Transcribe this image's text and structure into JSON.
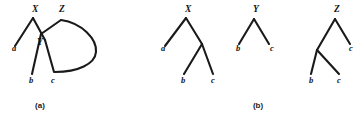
{
  "figure": {
    "background_color": "#ffffff",
    "ink_color": "#1a1a1a",
    "width": 362,
    "height": 120,
    "panels": [
      {
        "id": "panel-a",
        "caption": "(a)",
        "caption_x": 40,
        "caption_y": 108,
        "description": "Two overlapping tree structures whose branches cross; node X and node Z at top, node Y at the crossing, leaves a, b, c at bottom",
        "node_labels": [
          {
            "text": "X",
            "x": 32,
            "y": 12
          },
          {
            "text": "Z",
            "x": 59,
            "y": 12
          },
          {
            "text": "Y",
            "x": 37,
            "y": 45
          }
        ],
        "leaf_labels": [
          {
            "text": "a",
            "x": 12,
            "y": 51
          },
          {
            "text": "b",
            "x": 29,
            "y": 83
          },
          {
            "text": "c",
            "x": 51,
            "y": 83
          }
        ],
        "edges": [
          {
            "name": "x-to-a",
            "d": "M 33 18 L 15 46"
          },
          {
            "name": "x-to-cross",
            "d": "M 33 18 L 45 40"
          },
          {
            "name": "cross-to-c",
            "d": "M 45 40 L 54 72"
          },
          {
            "name": "y-to-b",
            "d": "M 41 34 L 32 74"
          },
          {
            "name": "z-to-y",
            "d": "M 61 20 L 41 34"
          },
          {
            "name": "z-arc-outer",
            "d": "M 61 20 C 82 23 97 39 96 52 C 95 64 78 72 55 72"
          }
        ]
      },
      {
        "id": "panel-b",
        "caption": "(b)",
        "caption_x": 258,
        "caption_y": 108,
        "description": "Three separate rooted trees labelled X, Y and Z showing leaves a, b and c",
        "trees": [
          {
            "name": "tree-x",
            "root_label": {
              "text": "X",
              "x": 185,
              "y": 12
            },
            "leaf_labels": [
              {
                "text": "a",
                "x": 161,
                "y": 51
              },
              {
                "text": "b",
                "x": 181,
                "y": 83
              },
              {
                "text": "c",
                "x": 211,
                "y": 83
              }
            ],
            "edges": [
              {
                "name": "x-to-a",
                "d": "M 186 18 L 165 46"
              },
              {
                "name": "x-to-internal",
                "d": "M 186 18 L 202 44"
              },
              {
                "name": "internal-to-b",
                "d": "M 202 44 L 184 74"
              },
              {
                "name": "internal-to-c",
                "d": "M 202 44 L 213 74"
              }
            ]
          },
          {
            "name": "tree-y",
            "root_label": {
              "text": "Y",
              "x": 253,
              "y": 12
            },
            "leaf_labels": [
              {
                "text": "b",
                "x": 236,
                "y": 51
              },
              {
                "text": "c",
                "x": 270,
                "y": 51
              }
            ],
            "edges": [
              {
                "name": "y-to-b",
                "d": "M 254 19 L 239 44"
              },
              {
                "name": "y-to-c",
                "d": "M 254 19 L 269 44"
              }
            ]
          },
          {
            "name": "tree-z",
            "root_label": {
              "text": "Z",
              "x": 334,
              "y": 12
            },
            "leaf_labels": [
              {
                "text": "c",
                "x": 349,
                "y": 51
              },
              {
                "text": "b",
                "x": 309,
                "y": 83
              },
              {
                "text": "c",
                "x": 337,
                "y": 83
              }
            ],
            "edges": [
              {
                "name": "z-to-c",
                "d": "M 335 19 L 350 44"
              },
              {
                "name": "z-to-internal",
                "d": "M 335 19 L 317 50"
              },
              {
                "name": "internal-to-b",
                "d": "M 317 50 L 311 74"
              },
              {
                "name": "internal-to-c",
                "d": "M 317 50 L 339 74"
              }
            ]
          }
        ]
      }
    ]
  }
}
